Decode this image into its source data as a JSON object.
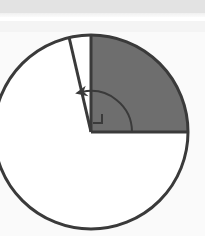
{
  "figure": {
    "title": "Circle with shaded quarter sector and marked central angle",
    "caption": "",
    "background_color": "#fafafa",
    "page_band_color": "#e3e3e3",
    "stroke_color": "#3a3a3a",
    "shaded_fill_color": "#6e6e6e",
    "unshaded_fill_color": "#ffffff"
  },
  "chart_data": {
    "type": "pie",
    "title": "Circle with shaded quarter sector and marked central angle",
    "xlabel": "",
    "ylabel": "",
    "legend": [],
    "annotations": [
      "right-angle square marker at center between vertical and horizontal radii",
      "curved arrow sweeping counterclockwise from horizontal radius to slanted radius"
    ],
    "categories": [
      "shaded quadrant",
      "narrow unshaded wedge",
      "large unshaded remainder"
    ],
    "values": [
      90,
      13,
      257
    ],
    "units": "degrees"
  },
  "geometry": {
    "circle": {
      "name": "main-circle",
      "center_x": 91,
      "center_y": 132,
      "radius": 97,
      "stroke_width": 3,
      "stroke": "#3a3a3a",
      "fill": "#ffffff"
    },
    "shaded_sector": {
      "name": "shaded-quadrant",
      "start_angle_deg": 0,
      "end_angle_deg": 90,
      "fill": "#6e6e6e",
      "description": "quarter sector between the rightward horizontal radius and the upward vertical radius"
    },
    "radii": [
      {
        "name": "vertical-radius",
        "angle_deg": 90,
        "end_x": 91,
        "end_y": 35,
        "stroke_width": 3,
        "label": ""
      },
      {
        "name": "horizontal-radius",
        "angle_deg": 0,
        "end_x": 188,
        "end_y": 132,
        "stroke_width": 3,
        "label": ""
      },
      {
        "name": "slanted-radius",
        "angle_deg": 103,
        "end_x": 69,
        "end_y": 37,
        "stroke_width": 3,
        "label": ""
      }
    ],
    "right_angle_marker": {
      "name": "right-angle-square",
      "x": 93,
      "y": 114,
      "size": 9,
      "stroke_width": 2,
      "measure_deg": 90
    },
    "angle_arc": {
      "name": "angle-sweep-arc",
      "radius": 41,
      "start_angle_deg": 0,
      "end_angle_deg": 103,
      "direction": "counterclockwise",
      "arrowhead": "end",
      "stroke_width": 2,
      "measure_deg": 103
    }
  }
}
